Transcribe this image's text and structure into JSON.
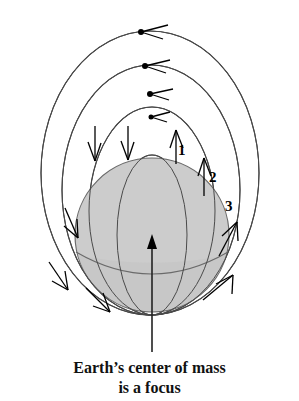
{
  "figure": {
    "earth": {
      "name": "Earth",
      "fill_color": "#cccccc",
      "stroke_color": "#555555",
      "center_x": 152,
      "center_y": 235,
      "radius": 77
    },
    "focus_marker": {
      "label": "focus-arrow",
      "tip_x": 152,
      "tip_y": 238
    },
    "orbit_labels": [
      {
        "id": "1",
        "text": "1",
        "x": 178,
        "y": 143
      },
      {
        "id": "2",
        "text": "2",
        "x": 209,
        "y": 170
      },
      {
        "id": "3",
        "text": "3",
        "x": 225,
        "y": 199
      }
    ],
    "orbits": [
      {
        "name": "orbit-1",
        "label": "1",
        "rx": 36,
        "ry": 93,
        "cx": 152,
        "cy": 145,
        "direction": "counterclockwise"
      },
      {
        "name": "orbit-2",
        "label": "2",
        "rx": 64,
        "ry": 135,
        "cx": 152,
        "cy": 115,
        "direction": "counterclockwise"
      },
      {
        "name": "orbit-3",
        "label": "3",
        "rx": 90,
        "ry": 160,
        "cx": 152,
        "cy": 92,
        "direction": "counterclockwise"
      },
      {
        "name": "orbit-4",
        "label": "",
        "rx": 111,
        "ry": 180,
        "cx": 150,
        "cy": 73,
        "direction": "counterclockwise"
      }
    ],
    "stroke_color": "#333333",
    "arrow_color": "#000000",
    "background_color": "#ffffff"
  },
  "caption": {
    "line1": "Earth’s center of mass",
    "line2": "is a focus"
  }
}
